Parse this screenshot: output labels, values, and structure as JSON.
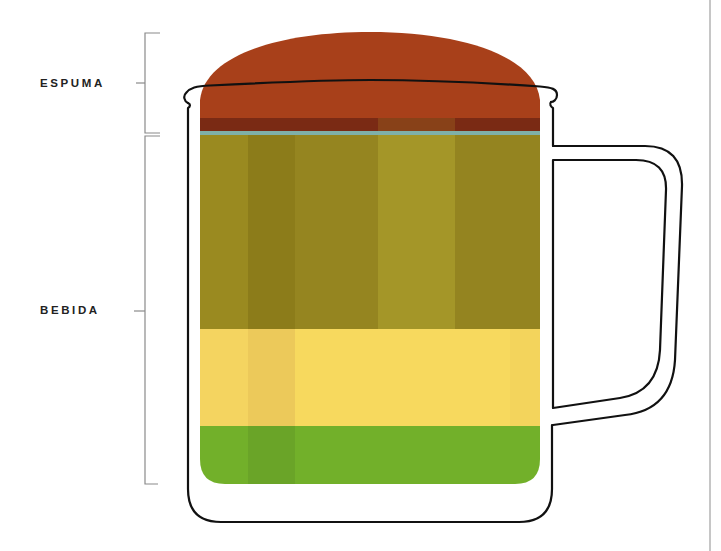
{
  "diagram": {
    "labels": {
      "foam": "ESPUMA",
      "drink": "BEBIDA"
    },
    "layers": [
      {
        "name": "foam",
        "color": "#a8401a"
      },
      {
        "name": "foam-bottom-band",
        "color": "#7a2a14"
      },
      {
        "name": "separator-line",
        "color": "#7fb0a8"
      },
      {
        "name": "olive-drink",
        "color": "#9a8a20"
      },
      {
        "name": "yellow-drink",
        "color": "#f5d85a"
      },
      {
        "name": "green-drink",
        "color": "#72b02a"
      }
    ],
    "colors": {
      "outline": "#111111",
      "bracket": "#8a8a8a",
      "divider": "#9a9a9a"
    }
  }
}
